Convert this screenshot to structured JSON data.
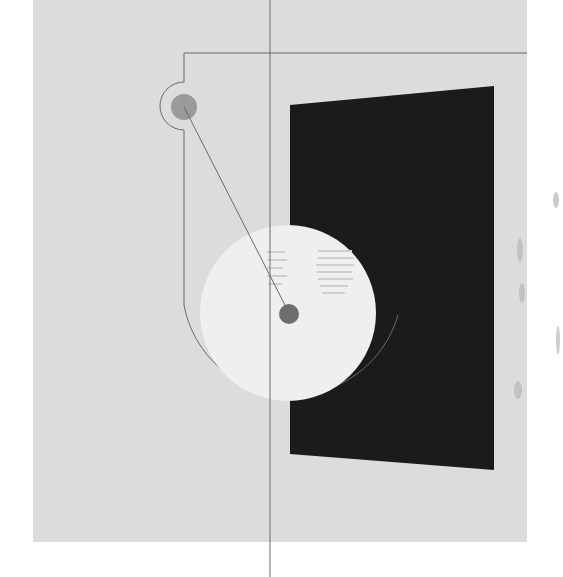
{
  "artwork": {
    "description": "Abstract geometric composition on grey paper",
    "colors": {
      "paper": "#dcdcdc",
      "background": "#ffffff",
      "black_panel": "#1b1b1b",
      "white_disc": "#efefef",
      "small_circle": "#9a9a9a",
      "center_dot": "#6e6e6e",
      "line": "#6a6a6a"
    }
  }
}
